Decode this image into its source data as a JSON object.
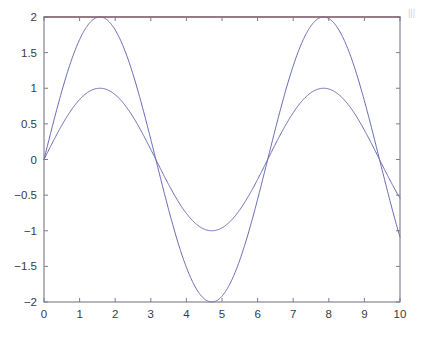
{
  "figure": {
    "background_color": "#ffffff",
    "axes_color": "#7a7a8c",
    "tick_label_color": "#3a3a42"
  },
  "chart_data": {
    "type": "line",
    "title": "",
    "subtitle": "",
    "xlabel": "",
    "ylabel": "",
    "xlim": [
      0,
      10
    ],
    "ylim": [
      -2,
      2
    ],
    "grid": false,
    "legend": false,
    "legend_position": "none",
    "x_ticks": [
      0,
      1,
      2,
      3,
      4,
      5,
      6,
      7,
      8,
      9,
      10
    ],
    "x_tick_labels": [
      "0",
      "1",
      "2",
      "3",
      "4",
      "5",
      "6",
      "7",
      "8",
      "9",
      "10"
    ],
    "y_ticks": [
      -2,
      -1.5,
      -1,
      -0.5,
      0,
      0.5,
      1,
      1.5,
      2
    ],
    "y_tick_labels": [
      "-2",
      "-1.5",
      "-1",
      "-0.5",
      "0",
      "0.5",
      "1",
      "1.5",
      "2"
    ],
    "series": [
      {
        "name": "sin(x)",
        "color": "#6a6ab4",
        "line_width": 1,
        "expression": "sin(x)",
        "x": [
          0,
          0.5,
          1,
          1.5708,
          2,
          2.5,
          3,
          3.1416,
          3.5,
          4,
          4.5,
          4.7124,
          5,
          5.5,
          6,
          6.2832,
          6.5,
          7,
          7.5,
          7.854,
          8,
          8.5,
          9,
          9.4248,
          9.5,
          10
        ],
        "values": [
          0,
          0.479,
          0.841,
          1,
          0.909,
          0.599,
          0.141,
          0,
          -0.351,
          -0.757,
          -0.978,
          -1,
          -0.959,
          -0.706,
          -0.279,
          0,
          0.215,
          0.657,
          0.938,
          1,
          0.989,
          0.798,
          0.412,
          0,
          -0.075,
          -0.544
        ]
      },
      {
        "name": "2*sin(x)",
        "color": "#6a6ab4",
        "line_width": 1,
        "expression": "2*sin(x)",
        "x": [
          0,
          0.5,
          1,
          1.5708,
          2,
          2.5,
          3,
          3.1416,
          3.5,
          4,
          4.5,
          4.7124,
          5,
          5.5,
          6,
          6.2832,
          6.5,
          7,
          7.5,
          7.854,
          8,
          8.5,
          9,
          9.4248,
          9.5,
          10
        ],
        "values": [
          0,
          0.959,
          1.683,
          2,
          1.819,
          1.197,
          0.282,
          0,
          -0.701,
          -1.514,
          -1.956,
          -2,
          -1.918,
          -1.411,
          -0.559,
          0,
          0.431,
          1.314,
          1.877,
          2,
          1.979,
          1.595,
          0.824,
          0,
          -0.15,
          -1.088
        ]
      },
      {
        "name": "clipped-top-line",
        "color": "#9e5555",
        "line_width": 1.4,
        "expression": "y = 2",
        "x": [
          0,
          10
        ],
        "values": [
          2,
          2
        ]
      }
    ]
  },
  "edge_fragment": {
    "text": "|||"
  }
}
